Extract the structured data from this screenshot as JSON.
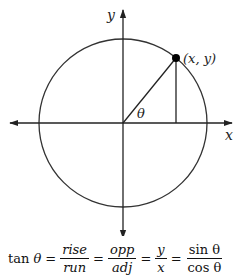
{
  "diagram": {
    "axes": {
      "x_label": "x",
      "y_label": "y"
    },
    "point_label": "(x, y)",
    "angle_label": "θ",
    "geometry": {
      "center": [
        123,
        123
      ],
      "radius": 84,
      "point": [
        176,
        58
      ],
      "x_axis": [
        8,
        222
      ],
      "y_axis": [
        10,
        233
      ]
    },
    "colors": {
      "stroke": "#222222",
      "point": "#000000",
      "background": "#ffffff"
    }
  },
  "formula": {
    "lhs_fn": "tan",
    "lhs_var": "θ",
    "equals": "=",
    "fractions": [
      {
        "num": "rise",
        "den": "run"
      },
      {
        "num": "opp",
        "den": "adj"
      },
      {
        "num": "y",
        "den": "x"
      },
      {
        "num": "sin θ",
        "den": "cos θ"
      }
    ]
  }
}
